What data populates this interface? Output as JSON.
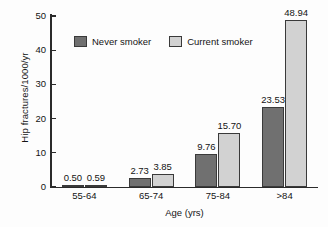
{
  "chart_data": {
    "type": "bar",
    "title": "",
    "xlabel": "Age (yrs)",
    "ylabel": "Hip fractures/1000/yr",
    "categories": [
      "55-64",
      "65-74",
      "75-84",
      ">84"
    ],
    "series": [
      {
        "name": "Never smoker",
        "color": "#707070",
        "values": [
          0.5,
          2.73,
          9.76,
          23.53
        ],
        "value_labels": [
          "0.50",
          "2.73",
          "9.76",
          "23.53"
        ]
      },
      {
        "name": "Current smoker",
        "color": "#d2d2d2",
        "values": [
          0.59,
          3.85,
          15.7,
          48.94
        ],
        "value_labels": [
          "0.59",
          "3.85",
          "15.70",
          "48.94"
        ]
      }
    ],
    "ylim": [
      0,
      50
    ],
    "yticks": [
      0,
      10,
      20,
      30,
      40,
      50
    ],
    "ytick_labels": [
      "0",
      "10",
      "20",
      "30",
      "40",
      "50"
    ],
    "grid": false,
    "legend_position": "upper-left-inside",
    "show_value_labels": true
  },
  "axes": {
    "y_label": "Hip fractures/1000/yr",
    "x_label": "Age (yrs)"
  },
  "legend": {
    "items": [
      {
        "label": "Never smoker",
        "color": "#707070"
      },
      {
        "label": "Current smoker",
        "color": "#d2d2d2"
      }
    ]
  }
}
